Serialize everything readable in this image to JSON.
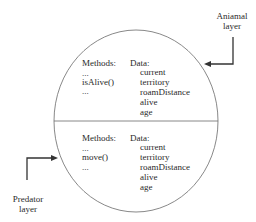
{
  "labels": {
    "animal_layer": [
      "Aniamal",
      "layer"
    ],
    "predator_layer": [
      "Predator",
      "layer"
    ]
  },
  "top_section": {
    "methods_header": "Methods:",
    "methods": [
      "...",
      "isAlive()",
      "..."
    ],
    "data_header": "Data:",
    "data": [
      "current",
      "territory",
      "roamDistance",
      "alive",
      "age"
    ]
  },
  "bottom_section": {
    "methods_header": "Methods:",
    "methods": [
      "...",
      "move()",
      "..."
    ],
    "data_header": "Data:",
    "data": [
      "current",
      "territory",
      "roamDistance",
      "alive",
      "age"
    ]
  },
  "colors": {
    "stroke": "#555555",
    "arrow": "#333333"
  }
}
